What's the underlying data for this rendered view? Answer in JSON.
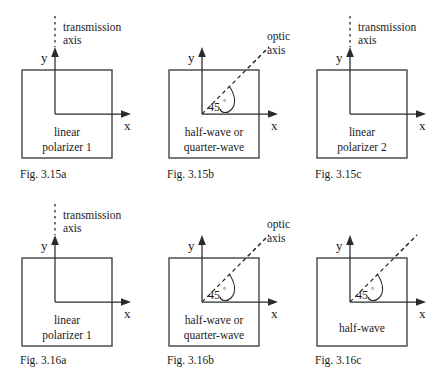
{
  "page": {
    "background_color": "#ffffff",
    "ink_color": "#2b2b2b",
    "width": 443,
    "height": 376
  },
  "common": {
    "axis_y_label": "y",
    "axis_x_label": "x",
    "angle_value": "45",
    "degree_symbol": "°",
    "transmission_axis_line1": "transmission",
    "transmission_axis_line2": "axis",
    "optic_axis_line1": "optic",
    "optic_axis_line2": "axis"
  },
  "figures": [
    {
      "id": "fig-3-15a",
      "caption": "Fig. 3.15a",
      "box_label_line1": "linear",
      "box_label_line2": "polarizer 1",
      "axis_annotation": "transmission axis",
      "has_dashed_vertical": true,
      "has_dashed_diagonal": false,
      "has_angle_marker": false,
      "has_optic_axis_label": false
    },
    {
      "id": "fig-3-15b",
      "caption": "Fig. 3.15b",
      "box_label_line1": "half-wave or",
      "box_label_line2": "quarter-wave",
      "axis_annotation": "optic axis",
      "has_dashed_vertical": false,
      "has_dashed_diagonal": true,
      "has_angle_marker": true,
      "has_optic_axis_label": true
    },
    {
      "id": "fig-3-15c",
      "caption": "Fig. 3.15c",
      "box_label_line1": "linear",
      "box_label_line2": "polarizer 2",
      "axis_annotation": "transmission axis",
      "has_dashed_vertical": true,
      "has_dashed_diagonal": false,
      "has_angle_marker": false,
      "has_optic_axis_label": false
    },
    {
      "id": "fig-3-16a",
      "caption": "Fig. 3.16a",
      "box_label_line1": "linear",
      "box_label_line2": "polarizer 1",
      "axis_annotation": "transmission axis",
      "has_dashed_vertical": true,
      "has_dashed_diagonal": false,
      "has_angle_marker": false,
      "has_optic_axis_label": false
    },
    {
      "id": "fig-3-16b",
      "caption": "Fig. 3.16b",
      "box_label_line1": "half-wave or",
      "box_label_line2": "quarter-wave",
      "axis_annotation": "optic axis",
      "has_dashed_vertical": false,
      "has_dashed_diagonal": true,
      "has_angle_marker": true,
      "has_optic_axis_label": true
    },
    {
      "id": "fig-3-16c",
      "caption": "Fig. 3.16c",
      "box_label_line1": "half-wave",
      "box_label_line2": "",
      "axis_annotation": "",
      "has_dashed_vertical": false,
      "has_dashed_diagonal": true,
      "has_angle_marker": true,
      "has_optic_axis_label": false
    }
  ]
}
